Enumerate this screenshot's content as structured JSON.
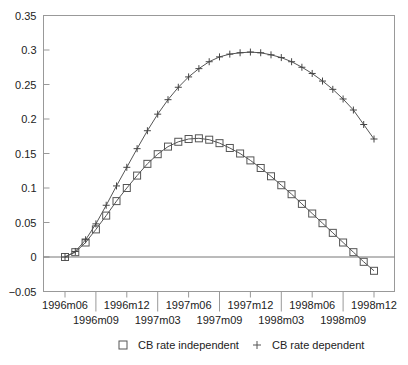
{
  "chart_data": {
    "type": "line",
    "title": "",
    "xlabel": "",
    "ylabel": "",
    "ylim": [
      -0.05,
      0.35
    ],
    "grid": false,
    "legend_position": "bottom",
    "yticks": [
      -0.05,
      0,
      0.05,
      0.1,
      0.15,
      0.2,
      0.25,
      0.3,
      0.35
    ],
    "ytick_labels": [
      "−0.05",
      "0",
      "0.05",
      "0.1",
      "0.15",
      "0.2",
      "0.25",
      "0.3",
      "0.35"
    ],
    "xticks_upper": [
      "1996m06",
      "1996m12",
      "1997m06",
      "1997m12",
      "1998m06",
      "1998m12"
    ],
    "xticks_lower": [
      "1996m09",
      "1997m03",
      "1997m09",
      "1998m03",
      "1998m09"
    ],
    "x": [
      "1996m06",
      "1996m07",
      "1996m08",
      "1996m09",
      "1996m10",
      "1996m11",
      "1996m12",
      "1997m01",
      "1997m02",
      "1997m03",
      "1997m04",
      "1997m05",
      "1997m06",
      "1997m07",
      "1997m08",
      "1997m09",
      "1997m10",
      "1997m11",
      "1997m12",
      "1998m01",
      "1998m02",
      "1998m03",
      "1998m04",
      "1998m05",
      "1998m06",
      "1998m07",
      "1998m08",
      "1998m09",
      "1998m10",
      "1998m11",
      "1998m12"
    ],
    "series": [
      {
        "name": "CB rate independent",
        "marker": "square",
        "values": [
          0,
          0.007,
          0.021,
          0.04,
          0.06,
          0.081,
          0.1,
          0.118,
          0.135,
          0.149,
          0.16,
          0.167,
          0.171,
          0.172,
          0.17,
          0.165,
          0.158,
          0.15,
          0.14,
          0.129,
          0.117,
          0.104,
          0.091,
          0.077,
          0.063,
          0.049,
          0.035,
          0.021,
          0.007,
          -0.007,
          -0.02
        ]
      },
      {
        "name": "CB rate dependent",
        "marker": "plus",
        "values": [
          0,
          0.008,
          0.025,
          0.048,
          0.075,
          0.103,
          0.13,
          0.157,
          0.183,
          0.207,
          0.228,
          0.246,
          0.261,
          0.273,
          0.283,
          0.29,
          0.294,
          0.296,
          0.297,
          0.296,
          0.293,
          0.289,
          0.283,
          0.275,
          0.266,
          0.255,
          0.243,
          0.229,
          0.213,
          0.192,
          0.171
        ]
      }
    ]
  },
  "legend": {
    "items": [
      {
        "label": "CB rate independent",
        "marker": "square-icon"
      },
      {
        "label": "CB rate dependent",
        "marker": "plus-icon"
      }
    ]
  }
}
